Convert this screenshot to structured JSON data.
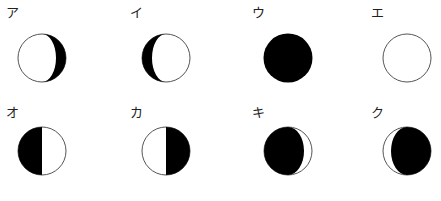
{
  "diagram": {
    "type": "moon-phases",
    "colors": {
      "dark": "#000000",
      "light": "#ffffff",
      "outline": "#555555"
    },
    "panels": [
      {
        "id": "a",
        "label": "ア",
        "phase": "waxing-crescent-right-dark",
        "description": "lit left, dark crescent on right"
      },
      {
        "id": "i",
        "label": "イ",
        "phase": "left-dark-crescent",
        "description": "dark crescent on left, lit right"
      },
      {
        "id": "u",
        "label": "ウ",
        "phase": "new-moon",
        "description": "fully dark"
      },
      {
        "id": "e",
        "label": "エ",
        "phase": "full-moon",
        "description": "fully lit"
      },
      {
        "id": "o",
        "label": "オ",
        "phase": "half-left-dark",
        "description": "left half dark"
      },
      {
        "id": "ka",
        "label": "カ",
        "phase": "half-right-dark",
        "description": "right half dark"
      },
      {
        "id": "ki",
        "label": "キ",
        "phase": "thin-lit-right",
        "description": "mostly dark, thin lit crescent on right"
      },
      {
        "id": "ku",
        "label": "ク",
        "phase": "thin-lit-left",
        "description": "mostly dark, thin lit crescent on left"
      }
    ]
  }
}
